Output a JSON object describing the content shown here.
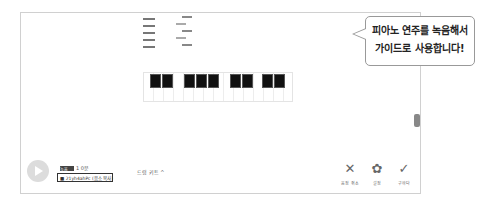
{
  "bubble": {
    "line1": "피아노 연주를 녹음해서",
    "line2": "가이드로 사용합니다!"
  },
  "player": {
    "play_icon": "play-icon",
    "badge": "녹음",
    "badge_label": "1 0분",
    "record_box": "■ 21yh4ahPc (음소 복사)"
  },
  "mode": {
    "label": "드럼 키트",
    "chevron": "^"
  },
  "actions": [
    {
      "icon": "✕",
      "label": "음정 취소"
    },
    {
      "icon": "✿",
      "label": "설정"
    },
    {
      "icon": "✓",
      "label": "구하다"
    }
  ]
}
